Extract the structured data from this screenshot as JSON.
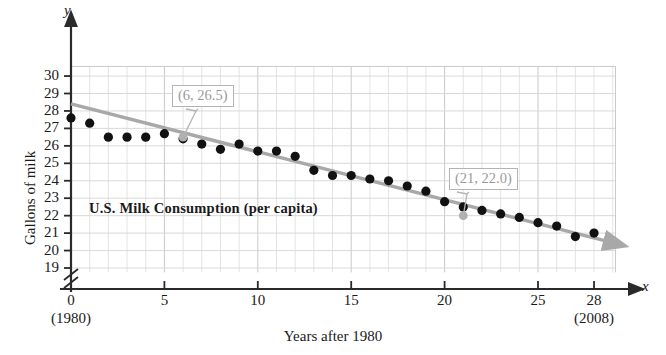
{
  "chart_data": {
    "type": "scatter",
    "title": "U.S. Milk Consumption (per capita)",
    "xlabel": "Years after 1980",
    "ylabel": "Gallons of milk",
    "xlim": [
      0,
      29.2
    ],
    "ylim": [
      18.6,
      30.6
    ],
    "grid": true,
    "legend": null,
    "x_axis_variable": "x",
    "y_axis_variable": "y",
    "y_axis_broken": true,
    "xticks": [
      0,
      5,
      10,
      15,
      20,
      25,
      28
    ],
    "xticklabels": [
      "0",
      "5",
      "10",
      "15",
      "20",
      "25",
      "28"
    ],
    "yticks": [
      19,
      20,
      21,
      22,
      23,
      24,
      25,
      26,
      27,
      28,
      29,
      30
    ],
    "yticklabels": [
      "19",
      "20",
      "21",
      "22",
      "23",
      "24",
      "25",
      "26",
      "27",
      "28",
      "29",
      "30"
    ],
    "x_origin_note": "(1980)",
    "x_end_note": "(2008)",
    "x": [
      0,
      1,
      2,
      3,
      4,
      5,
      6,
      7,
      8,
      9,
      10,
      11,
      12,
      13,
      14,
      15,
      16,
      17,
      18,
      19,
      20,
      21,
      22,
      23,
      24,
      25,
      26,
      27,
      28
    ],
    "values": [
      27.6,
      27.3,
      26.5,
      26.5,
      26.5,
      26.7,
      26.4,
      26.1,
      25.8,
      26.1,
      25.7,
      25.7,
      25.4,
      24.6,
      24.3,
      24.3,
      24.1,
      24.0,
      23.7,
      23.4,
      22.8,
      22.5,
      22.3,
      22.1,
      21.9,
      21.6,
      21.4,
      20.8,
      21.0
    ],
    "series": [
      {
        "name": "Gallons of milk per capita",
        "type": "scatter",
        "marker_color": "#111111",
        "values": [
          27.6,
          27.3,
          26.5,
          26.5,
          26.5,
          26.7,
          26.4,
          26.1,
          25.8,
          26.1,
          25.7,
          25.7,
          25.4,
          24.6,
          24.3,
          24.3,
          24.1,
          24.0,
          23.7,
          23.4,
          22.8,
          22.5,
          22.3,
          22.1,
          21.9,
          21.6,
          21.4,
          20.8,
          21.0
        ]
      },
      {
        "name": "trend line",
        "type": "line",
        "line_color": "#a8a8a8",
        "x_start": 0,
        "y_start": 28.4,
        "x_end": 29.1,
        "y_end": 20.65,
        "slope": -0.3,
        "intercept": 28.3,
        "arrow_end": true
      }
    ],
    "annotations": [
      {
        "label": "(6, 26.5)",
        "x": 6,
        "y": 26.5,
        "point_color": "#b0b0b0"
      },
      {
        "label": "(21, 22.0)",
        "x": 21,
        "y": 22.0,
        "point_color": "#b0b0b0"
      }
    ],
    "colors": {
      "grid": "#d8d8d8",
      "axis": "#2a2a2a",
      "marker": "#111111",
      "trend": "#a8a8a8",
      "callout_text": "#9a9a9a",
      "callout_border": "#b4b4b4"
    }
  }
}
